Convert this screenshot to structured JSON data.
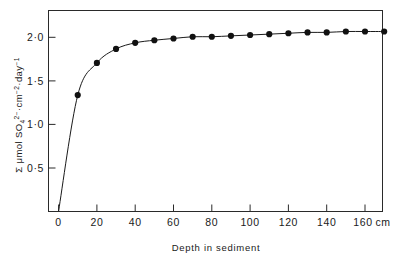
{
  "chart_data": {
    "type": "line",
    "title": "",
    "subtitle": "",
    "xlabel": "Depth in sediment",
    "ylabel": "Σ μmol SO₄²⁻·cm⁻²·day⁻¹",
    "ylabel_parts": {
      "sigma": "Σ",
      "units_prefix": "μmol SO",
      "so4_sub": "4",
      "so4_charge": "2−",
      "cm": "·cm",
      "cm_exp": "−2",
      "day": "·day",
      "day_exp": "−1"
    },
    "x_unit": "cm",
    "xlim": [
      0,
      170
    ],
    "ylim": [
      0,
      2.25
    ],
    "x_ticks": [
      0,
      20,
      40,
      60,
      80,
      100,
      120,
      140,
      160
    ],
    "x_tick_labels": [
      "0",
      "20",
      "40",
      "60",
      "80",
      "100",
      "120",
      "140",
      "160"
    ],
    "x_tick_unit_suffix": "cm",
    "y_ticks": [
      0.5,
      1.0,
      1.5,
      2.0
    ],
    "y_tick_labels": [
      "0·5",
      "1·0",
      "1·5",
      "2·0"
    ],
    "grid": false,
    "legend": null,
    "marker": "filled-circle",
    "line_style": "solid-through-origin",
    "x": [
      0,
      10,
      20,
      30,
      40,
      50,
      60,
      70,
      80,
      90,
      100,
      110,
      120,
      130,
      140,
      150,
      160,
      170
    ],
    "values": [
      0,
      1.33,
      1.7,
      1.86,
      1.93,
      1.96,
      1.98,
      2.0,
      2.0,
      2.01,
      2.02,
      2.03,
      2.04,
      2.05,
      2.05,
      2.06,
      2.06,
      2.06
    ],
    "markers_shown_from_index": 1,
    "series": [
      {
        "name": "Cumulative sulfate reduction",
        "x": [
          10,
          20,
          30,
          40,
          50,
          60,
          70,
          80,
          90,
          100,
          110,
          120,
          130,
          140,
          150,
          160,
          170
        ],
        "values": [
          1.33,
          1.7,
          1.86,
          1.93,
          1.96,
          1.98,
          2.0,
          2.0,
          2.01,
          2.02,
          2.03,
          2.04,
          2.05,
          2.05,
          2.06,
          2.06,
          2.06
        ]
      }
    ],
    "annotations": []
  },
  "colors": {
    "background": "#ffffff",
    "axis": "#2a2a2a",
    "curve": "#1a1a1a",
    "marker": "#111111",
    "text": "#1a1a1a"
  }
}
